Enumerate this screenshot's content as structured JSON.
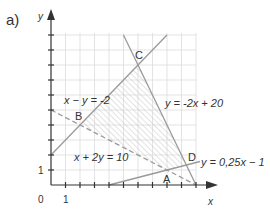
{
  "part_label": "a)",
  "axes": {
    "x_label": "x",
    "y_label": "y",
    "origin_label": "0",
    "x_tick_label": "1",
    "y_tick_label": "1",
    "x_range": [
      0,
      10
    ],
    "y_range": [
      0,
      10
    ]
  },
  "lines": [
    {
      "equation": "x − y = -2",
      "style": "solid"
    },
    {
      "equation": "y = -2x + 20",
      "style": "solid"
    },
    {
      "equation": "x + 2y = 10",
      "style": "dashed"
    },
    {
      "equation": "y = 0,25x − 1",
      "style": "solid"
    }
  ],
  "points": [
    {
      "name": "A",
      "x": 8,
      "y": 1
    },
    {
      "name": "B",
      "x": 2,
      "y": 4
    },
    {
      "name": "C",
      "x": 6,
      "y": 8
    },
    {
      "name": "D",
      "x": 9.33,
      "y": 1.33
    }
  ],
  "feasible_region": "hatched polygon A-B-C-D",
  "colors": {
    "line": "#9a9a9a",
    "grid": "#dcdcdc",
    "hatch": "#c8c8c8",
    "axis": "#333333"
  }
}
